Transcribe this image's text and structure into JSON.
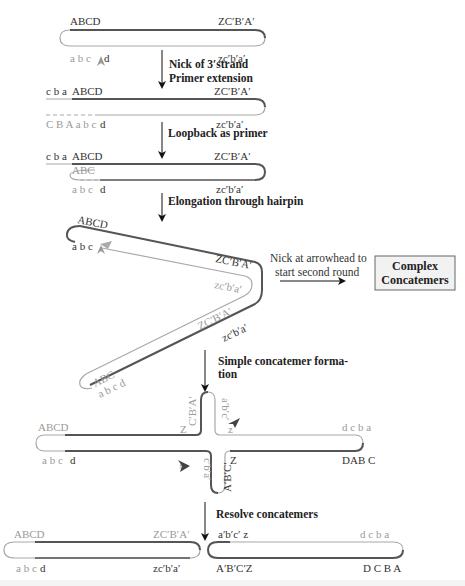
{
  "colors": {
    "dark_strand": "#555555",
    "light_strand": "#a8a8a8",
    "box_bg": "#f2f2f2",
    "arrow": "#111111"
  },
  "steps": [
    {
      "label_line1": "Nick of 3′strand",
      "label_line2": "Primer extension"
    },
    {
      "label_line1": "Loopback as primer"
    },
    {
      "label_line1": "Elongation through hairpin"
    },
    {
      "label_line1": "Simple concatemer forma-",
      "label_line2": "tion"
    },
    {
      "label_line1": "Resolve concatemers"
    }
  ],
  "stage1": {
    "top_left": "ABCD",
    "top_right": "ZC′B′A′",
    "bottom_left": "a b c",
    "bottom_left_d": "d",
    "bottom_right": "zc′b′a′"
  },
  "stage2": {
    "top_left_pre": "c b a",
    "top_left": "ABCD",
    "top_right": "ZC′B′A′",
    "bottom_left_pre": "C B A a b c",
    "bottom_left_d": "d",
    "bottom_right": "zc′b′a′"
  },
  "stage3": {
    "top_left_pre": "c b a",
    "top_left": "ABCD",
    "top_right": "ZC′B′A′",
    "inner_left": "ABC",
    "bottom_left": "a b c",
    "bottom_left_d": "d",
    "bottom_right": "zc′b′a′"
  },
  "stage4": {
    "top_left": "ABCD",
    "top_left_lower": "a b c",
    "mid_upper": "ZC′B′A′",
    "mid_lower": "zc′b′a′",
    "diag_upper": "ZC′B′A′",
    "diag_lower": "zc′b′a′",
    "end_upper": "ABC",
    "end_lower": "a b c d"
  },
  "side_note": {
    "line1": "Nick at arrowhead to",
    "line2": "start second round"
  },
  "result_box": {
    "line1": "Complex",
    "line2": "Concatemers"
  },
  "stage5": {
    "left_top": "ABCD",
    "left_bottom": "a b c",
    "left_bottom_d": "d",
    "upper_arm_left": "C′B′A′",
    "upper_arm_right": "a′b′c′",
    "z1": "Z",
    "z2": "z",
    "z3": "z",
    "z4": "Z",
    "lower_arm_left": "c′b′a′",
    "lower_arm_right": "A′B′C′",
    "right_top": "d c b a",
    "right_bottom": "DAB C"
  },
  "stage6": {
    "left_top_left": "ABCD",
    "left_top_right": "ZC′B′A′",
    "left_bottom_left": "a b c",
    "left_bottom_d": "d",
    "left_bottom_right": "zc′b′a′",
    "right_top_left": "a′b′c′ z",
    "right_top_right": "d c b a",
    "right_bottom_left": "A′B′C′Z",
    "right_bottom_right": "D C B A"
  }
}
